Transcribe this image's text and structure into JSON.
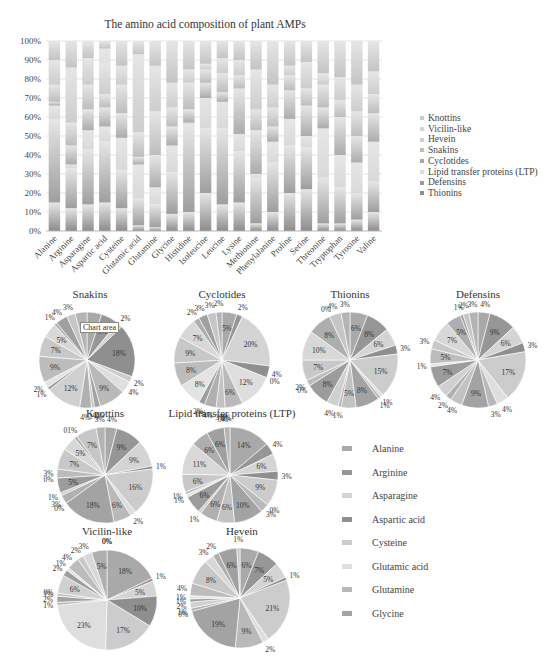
{
  "chart_data": [
    {
      "type": "bar",
      "stacked": "percent",
      "title": "The amino acid composition of plant AMPs",
      "xlabel": "",
      "ylabel": "",
      "ylim": [
        0,
        100
      ],
      "y_ticks": [
        "0%",
        "10%",
        "20%",
        "30%",
        "40%",
        "50%",
        "60%",
        "70%",
        "80%",
        "90%",
        "100%"
      ],
      "grid": true,
      "legend_position": "right",
      "categories": [
        "Alanine",
        "Arginine",
        "Asparagine",
        "Aspartic acid",
        "Cysteine",
        "Glutamic acid",
        "Glutamine",
        "Glycine",
        "Histidine",
        "Isoleucine",
        "Leucine",
        "Lysine",
        "Methionine",
        "Phenylalanine",
        "Proline",
        "Serine",
        "Threonine",
        "Tryptophan",
        "Tyrosine",
        "Valine"
      ],
      "series": [
        {
          "name": "Thionins",
          "values": [
            15,
            12,
            14,
            15,
            12,
            3,
            2,
            9,
            10,
            20,
            14,
            15,
            4,
            10,
            20,
            22,
            4,
            4,
            6,
            10
          ]
        },
        {
          "name": "Defensins",
          "values": [
            44,
            21,
            29,
            32,
            20,
            14,
            12,
            22,
            46,
            34,
            40,
            27,
            24,
            26,
            25,
            22,
            24,
            19,
            14,
            16
          ]
        },
        {
          "name": "Lipid transfer proteins (LTP)",
          "values": [
            7,
            2,
            10,
            8,
            17,
            18,
            9,
            14,
            1,
            16,
            14,
            9,
            2,
            11,
            14,
            6,
            26,
            17,
            16,
            21
          ]
        },
        {
          "name": "Cyclotides",
          "values": [
            2,
            10,
            11,
            10,
            13,
            4,
            17,
            10,
            7,
            8,
            5,
            24,
            23,
            8,
            15,
            16,
            11,
            20,
            14,
            15
          ]
        },
        {
          "name": "Snakins",
          "values": [
            9,
            12,
            13,
            7,
            15,
            13,
            23,
            10,
            14,
            7,
            10,
            7,
            11,
            10,
            8,
            9,
            12,
            9,
            13,
            10
          ]
        },
        {
          "name": "Hevein",
          "values": [
            13,
            29,
            14,
            16,
            10,
            41,
            24,
            13,
            7,
            3,
            8,
            8,
            21,
            12,
            5,
            14,
            6,
            12,
            14,
            12
          ]
        },
        {
          "name": "Vicilin-like",
          "values": [
            0,
            0,
            0,
            8,
            0,
            0,
            0,
            0,
            0,
            0,
            0,
            0,
            0,
            0,
            0,
            0,
            0,
            0,
            0,
            0
          ]
        },
        {
          "name": "Knottins",
          "values": [
            10,
            14,
            9,
            4,
            13,
            7,
            13,
            22,
            15,
            12,
            9,
            10,
            15,
            23,
            13,
            11,
            17,
            19,
            23,
            16
          ]
        }
      ],
      "legend": [
        "Knottins",
        "Vicilin-like",
        "Hevein",
        "Snakins",
        "Cyclotides",
        "Lipid transfer proteins (LTP)",
        "Defensins",
        "Thionins"
      ]
    },
    {
      "type": "pie",
      "title": "Snakins",
      "labels": [
        "Alanine",
        "Arginine",
        "Asparagine",
        "Aspartic acid",
        "Cysteine",
        "Glutamic acid",
        "Glutamine",
        "Glycine",
        "Histidine",
        "Isoleucine",
        "Leucine",
        "Lysine",
        "Methionine",
        "Phenylalanine",
        "Proline",
        "Serine",
        "Threonine",
        "Tryptophan",
        "Tyrosine",
        "Valine"
      ],
      "values": [
        5,
        6,
        2,
        18,
        2,
        4,
        9,
        2,
        1,
        4,
        12,
        1,
        2,
        9,
        7,
        5,
        1,
        4,
        3,
        4
      ],
      "data_labels": [
        "5%",
        "6%",
        "2%",
        "18%",
        "2%",
        "4%",
        "9%",
        "2%",
        "1%",
        "4%",
        "12%",
        "1%",
        "2%",
        "9%",
        "7%",
        "5%",
        "1%",
        "4%",
        "3%",
        ""
      ]
    },
    {
      "type": "pie",
      "title": "Cyclotides",
      "values": [
        5,
        2,
        20,
        4,
        0,
        12,
        6,
        0,
        3,
        4,
        0,
        2,
        8,
        8,
        9,
        7,
        2,
        3,
        3,
        2
      ],
      "data_labels": [
        "5%",
        "2%",
        "20%",
        "4%",
        "0%",
        "12%",
        "6%",
        "0%",
        "3%",
        "4%",
        "0%",
        "2%",
        "8%",
        "8%",
        "9%",
        "7%",
        "2%",
        "3%",
        "3%",
        "2%"
      ]
    },
    {
      "type": "pie",
      "title": "Thionins",
      "values": [
        6,
        8,
        6,
        3,
        15,
        1,
        1,
        8,
        5,
        1,
        4,
        8,
        0,
        2,
        7,
        10,
        8,
        0,
        4,
        3
      ],
      "data_labels": [
        "6%",
        "8%",
        "6%",
        "3%",
        "15%",
        "1%",
        "1%",
        "8%",
        "5%",
        "1%",
        "4%",
        "8%",
        "0%",
        "2%",
        "7%",
        "10%",
        "8%",
        "0%",
        "4%",
        "3%"
      ]
    },
    {
      "type": "pie",
      "title": "Defensins",
      "values": [
        4,
        9,
        6,
        3,
        17,
        4,
        3,
        9,
        4,
        2,
        4,
        7,
        1,
        5,
        3,
        7,
        5,
        1,
        2,
        3
      ],
      "data_labels": [
        "4%",
        "9%",
        "6%",
        "3%",
        "17%",
        "4%",
        "3%",
        "9%",
        "4%",
        "2%",
        "4%",
        "7%",
        "1%",
        "5%",
        "3%",
        "7%",
        "5%",
        "1%",
        "2%",
        "3%"
      ]
    },
    {
      "type": "pie",
      "title": "Knottins",
      "values": [
        4,
        9,
        9,
        1,
        16,
        2,
        6,
        18,
        0,
        3,
        1,
        5,
        0,
        3,
        7,
        5,
        1,
        0,
        7,
        3
      ],
      "data_labels": [
        "4%",
        "9%",
        "9%",
        "1%",
        "16%",
        "2%",
        "6%",
        "18%",
        "0%",
        "3%",
        "1%",
        "5%",
        "0%",
        "3%",
        "7%",
        "5%",
        "01%",
        "",
        "7%",
        "3%"
      ]
    },
    {
      "type": "pie",
      "title": "Lipid transfer proteins (LTP)",
      "values": [
        14,
        4,
        6,
        3,
        9,
        0,
        3,
        10,
        6,
        6,
        1,
        6,
        1,
        1,
        6,
        11,
        6,
        6,
        0,
        2
      ],
      "data_labels": [
        "14%",
        "4%",
        "6%",
        "3%",
        "9%",
        "0%",
        "3%",
        "10%",
        "6%",
        "6%",
        "1%",
        "6%",
        "1%",
        "1%",
        "6%",
        "11%",
        "6%",
        "6%",
        "0%",
        "2%"
      ]
    },
    {
      "type": "pie",
      "title": "Vicilin-like",
      "values": [
        18,
        1,
        5,
        10,
        17,
        23,
        1,
        2,
        1,
        0,
        6,
        2,
        1,
        4,
        2,
        3,
        5,
        0,
        0,
        0
      ],
      "data_labels": [
        "18%",
        "1%",
        "5%",
        "10%",
        "17%",
        "23%",
        "1%",
        "2%",
        "1%",
        "0%",
        "6%",
        "2%",
        "1%",
        "4%",
        "2%",
        "3%",
        "5%",
        "0%",
        "0%",
        ""
      ]
    },
    {
      "type": "pie",
      "title": "Hevein",
      "values": [
        6,
        7,
        5,
        1,
        21,
        2,
        9,
        19,
        0,
        1,
        2,
        1,
        1,
        4,
        8,
        3,
        2,
        6,
        1,
        0
      ],
      "data_labels": [
        "6%",
        "7%",
        "5%",
        "1%",
        "21%",
        "2%",
        "9%",
        "19%",
        "0%",
        "1%",
        "2%",
        "1%",
        "1%",
        "4%",
        "8%",
        "3%",
        "2%",
        "6%",
        "1%",
        ""
      ]
    }
  ],
  "bar_title": "The amino acid composition of plant AMPs",
  "top_legend": [
    {
      "label": "Knottins",
      "color": "#c9c9c9"
    },
    {
      "label": "Vicilin-like",
      "color": "#d6d6d6"
    },
    {
      "label": "Hevein",
      "color": "#cfcfcf"
    },
    {
      "label": "Snakins",
      "color": "#bdbdbd"
    },
    {
      "label": "Cyclotides",
      "color": "#a8a8a8"
    },
    {
      "label": "Lipid transfer proteins (LTP)",
      "color": "#dcdcdc"
    },
    {
      "label": "Defensins",
      "color": "#9a9a9a"
    },
    {
      "label": "Thionins",
      "color": "#8c8c8c"
    }
  ],
  "bottom_legend": [
    {
      "label": "Alanine",
      "color": "#a9a9a9"
    },
    {
      "label": "Arginine",
      "color": "#969696"
    },
    {
      "label": "Asparagine",
      "color": "#d4d4d4"
    },
    {
      "label": "Aspartic acid",
      "color": "#8f8f8f"
    },
    {
      "label": "Cysteine",
      "color": "#cccccc"
    },
    {
      "label": "Glutamic acid",
      "color": "#dedede"
    },
    {
      "label": "Glutamine",
      "color": "#b9b9b9"
    },
    {
      "label": "Glycine",
      "color": "#a3a3a3"
    }
  ],
  "tooltip": "Chart area"
}
